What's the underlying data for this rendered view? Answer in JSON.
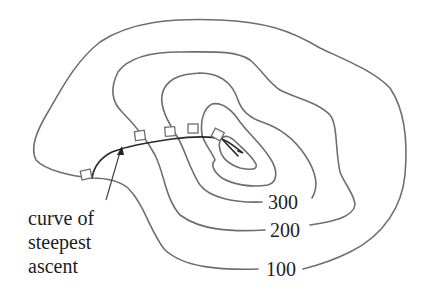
{
  "diagram": {
    "type": "contour-map",
    "contours": [
      {
        "level": "100",
        "label": "100"
      },
      {
        "level": "200",
        "label": "200"
      },
      {
        "level": "300",
        "label": "300"
      }
    ],
    "annotation": {
      "lines": [
        "curve of",
        "steepest",
        "ascent"
      ]
    },
    "right_angle_markers": 5,
    "colors": {
      "contour": "#6e6e6e",
      "ascent_curve": "#2a2a2a",
      "text": "#1e1e1e",
      "background": "#ffffff"
    }
  }
}
